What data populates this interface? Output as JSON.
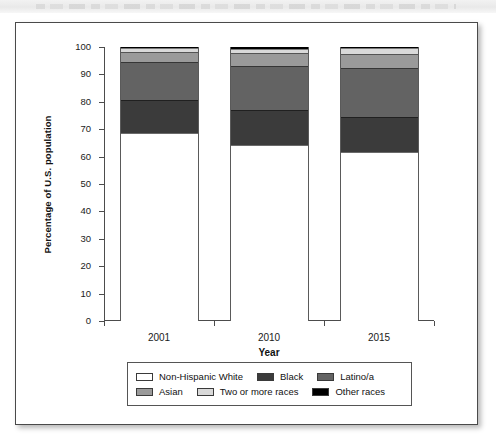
{
  "figure": {
    "frame_border_color": "#4a4a4a",
    "background": "#ffffff"
  },
  "chart_data": {
    "type": "bar",
    "subtype": "stacked-bar-100-percent",
    "title": "",
    "xlabel": "Year",
    "ylabel": "Percentage of U.S. population",
    "categories": [
      "2001",
      "2010",
      "2015"
    ],
    "ylim": [
      0,
      100
    ],
    "yticks": [
      0,
      10,
      20,
      30,
      40,
      50,
      60,
      70,
      80,
      90,
      100
    ],
    "ytick_labels": [
      "0",
      "10",
      "20",
      "30",
      "40",
      "50",
      "60",
      "70",
      "80",
      "90",
      "100"
    ],
    "grid": false,
    "legend_position": "below-axes",
    "stack_order_bottom_to_top": [
      "Non-Hispanic White",
      "Black",
      "Latino/a",
      "Asian",
      "Two or more races",
      "Other races"
    ],
    "series": [
      {
        "name": "Non-Hispanic White",
        "color": "#ffffff",
        "values": [
          68.5,
          64.3,
          61.6
        ]
      },
      {
        "name": "Black",
        "color": "#3b3b3b",
        "values": [
          12.3,
          12.6,
          13.0
        ]
      },
      {
        "name": "Latino/a",
        "color": "#636363",
        "values": [
          13.6,
          16.0,
          17.6
        ]
      },
      {
        "name": "Asian",
        "color": "#9a9a9a",
        "values": [
          3.8,
          4.8,
          5.4
        ]
      },
      {
        "name": "Two or more races",
        "color": "#d9d9d9",
        "values": [
          1.4,
          1.7,
          2.2
        ]
      },
      {
        "name": "Other races",
        "color": "#000000",
        "values": [
          0.4,
          0.6,
          0.2
        ]
      }
    ]
  },
  "legend": {
    "rows": [
      [
        {
          "label": "Non-Hispanic White",
          "color": "#ffffff"
        },
        {
          "label": "Black",
          "color": "#3b3b3b"
        },
        {
          "label": "Latino/a",
          "color": "#636363"
        }
      ],
      [
        {
          "label": "Asian",
          "color": "#9a9a9a"
        },
        {
          "label": "Two or more races",
          "color": "#d9d9d9"
        },
        {
          "label": "Other races",
          "color": "#000000"
        }
      ]
    ]
  }
}
